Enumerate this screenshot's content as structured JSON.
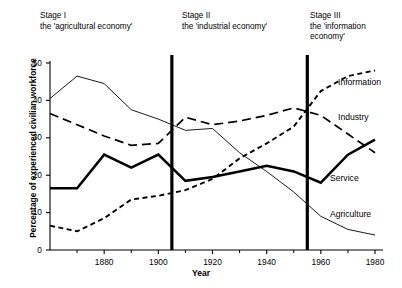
{
  "stages": [
    {
      "id": "stage-1",
      "title": "Stage I",
      "subtitle": "the 'agricultural economy'"
    },
    {
      "id": "stage-2",
      "title": "Stage II",
      "subtitle": "the 'industrial economy'"
    },
    {
      "id": "stage-3",
      "title": "Stage III",
      "subtitle": "the 'information\neconomy'"
    }
  ],
  "axes": {
    "y_title": "Percentage of experienced civilian workforce",
    "x_title": "Year",
    "y_ticks": [
      "0",
      "10",
      "20",
      "30",
      "40",
      "50"
    ],
    "x_ticks": [
      "1880",
      "1900",
      "1920",
      "1940",
      "1960",
      "1980"
    ]
  },
  "series_labels": {
    "information": "Information",
    "industry": "Industry",
    "service": "Service",
    "agriculture": "Agriculture"
  },
  "chart_data": {
    "type": "line",
    "title": "",
    "subtitle": "",
    "xlabel": "Year",
    "ylabel": "Percentage of experienced civilian workforce",
    "xlim": [
      1860,
      1980
    ],
    "ylim": [
      0,
      50
    ],
    "grid": false,
    "legend": "inline-right",
    "x_ticks": [
      1880,
      1900,
      1920,
      1940,
      1960,
      1980
    ],
    "x_minor_ticks": [
      1870,
      1890,
      1910,
      1930,
      1950,
      1970
    ],
    "y_ticks": [
      0,
      10,
      20,
      30,
      40,
      50
    ],
    "annotations": [
      {
        "type": "vline",
        "x": 1905,
        "label": "Stage I / Stage II boundary"
      },
      {
        "type": "vline",
        "x": 1955,
        "label": "Stage II / Stage III boundary"
      },
      {
        "type": "text",
        "x": 1862,
        "y": 56,
        "label": "Stage I"
      },
      {
        "type": "text",
        "x": 1862,
        "y": 53,
        "label": "the 'agricultural economy'"
      },
      {
        "type": "text",
        "x": 1908,
        "y": 56,
        "label": "Stage II"
      },
      {
        "type": "text",
        "x": 1908,
        "y": 53,
        "label": "the 'industrial economy'"
      },
      {
        "type": "text",
        "x": 1948,
        "y": 56,
        "label": "Stage III"
      },
      {
        "type": "text",
        "x": 1948,
        "y": 53,
        "label": "the 'information economy'"
      }
    ],
    "x": [
      1860,
      1870,
      1880,
      1890,
      1900,
      1910,
      1920,
      1930,
      1940,
      1950,
      1960,
      1970,
      1980
    ],
    "series": [
      {
        "name": "Agriculture",
        "style": "thin-solid",
        "values": [
          40.5,
          46.5,
          44.5,
          37.5,
          35.0,
          32.0,
          32.5,
          26.0,
          21.0,
          15.5,
          9.0,
          5.5,
          4.0
        ]
      },
      {
        "name": "Industry",
        "style": "long-dashed",
        "values": [
          36.5,
          33.5,
          30.5,
          28.0,
          28.5,
          35.5,
          33.5,
          34.5,
          36.0,
          38.0,
          36.0,
          31.0,
          26.0
        ]
      },
      {
        "name": "Service",
        "style": "thick-solid",
        "values": [
          16.5,
          16.5,
          25.5,
          22.0,
          25.5,
          18.5,
          19.5,
          21.0,
          22.5,
          21.0,
          18.0,
          25.5,
          29.5
        ]
      },
      {
        "name": "Information",
        "style": "short-dashed",
        "values": [
          6.5,
          5.0,
          8.5,
          13.5,
          14.5,
          16.0,
          19.0,
          24.5,
          28.5,
          33.0,
          42.5,
          46.5,
          48.0
        ]
      }
    ]
  }
}
